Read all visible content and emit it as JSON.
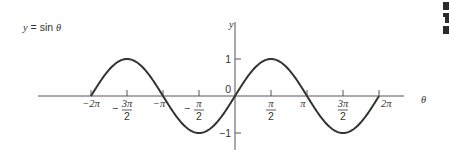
{
  "chart_data": {
    "type": "line",
    "title": "y = sin θ",
    "xlabel": "θ",
    "ylabel": "y",
    "function": "sin",
    "x_range_radians": [
      -6.2832,
      6.2832
    ],
    "xlim_label": [
      "-2π",
      "2π"
    ],
    "ylim": [
      -1,
      1
    ],
    "grid": false,
    "x_ticks": [
      {
        "value": -6.2832,
        "label_num": "−2π",
        "label_den": ""
      },
      {
        "value": -4.7124,
        "label_num": "3π",
        "label_den": "2",
        "sign": "−"
      },
      {
        "value": -3.1416,
        "label_num": "−π",
        "label_den": ""
      },
      {
        "value": -1.5708,
        "label_num": "π",
        "label_den": "2",
        "sign": "−"
      },
      {
        "value": 1.5708,
        "label_num": "π",
        "label_den": "2",
        "sign": ""
      },
      {
        "value": 3.1416,
        "label_num": "π",
        "label_den": ""
      },
      {
        "value": 4.7124,
        "label_num": "3π",
        "label_den": "2",
        "sign": ""
      },
      {
        "value": 6.2832,
        "label_num": "2π",
        "label_den": ""
      }
    ],
    "y_ticks": [
      {
        "value": 1,
        "label": "1"
      },
      {
        "value": 0,
        "label": "0"
      },
      {
        "value": -1,
        "label": "−1"
      }
    ],
    "series": [
      {
        "name": "sin θ",
        "x": [
          "-2π",
          "-3π/2",
          "-π",
          "-π/2",
          "0",
          "π/2",
          "π",
          "3π/2",
          "2π"
        ],
        "values": [
          0,
          1,
          0,
          -1,
          0,
          1,
          0,
          -1,
          0
        ]
      }
    ]
  },
  "labels": {
    "equation": "y = sin θ",
    "y_axis": "y",
    "x_axis": "θ"
  }
}
